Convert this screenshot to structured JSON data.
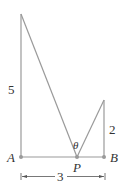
{
  "diagram": {
    "labels": {
      "A": "A",
      "B": "B",
      "P": "P",
      "theta": "θ",
      "left_height": "5",
      "right_height": "2",
      "base_length": "3"
    },
    "colors": {
      "line": "#9a9a9a",
      "dimension": "#555555",
      "text": "#333333"
    }
  }
}
